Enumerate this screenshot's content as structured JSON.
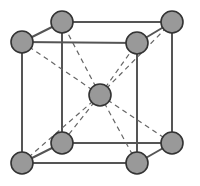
{
  "figure": {
    "background_color": "#ffffff",
    "width": 200,
    "height": 186
  },
  "style": {
    "atom_fill": "#999999",
    "atom_stroke": "#333333",
    "atom_stroke_width": 1.6,
    "atom_radius": 11,
    "edge_color": "#555555",
    "edge_width": 2,
    "diagonal_color": "#666666",
    "diagonal_width": 1.2,
    "diagonal_dash": "5,4"
  },
  "geometry": {
    "front_face": {
      "name": "front-face",
      "corners": [
        {
          "id": "front-top-left",
          "x": 22,
          "y": 42
        },
        {
          "id": "front-top-right",
          "x": 137,
          "y": 43
        },
        {
          "id": "front-bottom-right",
          "x": 137,
          "y": 163
        },
        {
          "id": "front-bottom-left",
          "x": 22,
          "y": 163
        }
      ]
    },
    "back_face": {
      "name": "back-face",
      "corners": [
        {
          "id": "back-top-left",
          "x": 62,
          "y": 22
        },
        {
          "id": "back-top-right",
          "x": 172,
          "y": 22
        },
        {
          "id": "back-bottom-right",
          "x": 172,
          "y": 143
        },
        {
          "id": "back-bottom-left",
          "x": 62,
          "y": 143
        }
      ]
    },
    "connectors": [
      {
        "id": "edge-top-left",
        "from": "front-top-left",
        "to": "back-top-left"
      },
      {
        "id": "edge-top-right",
        "from": "front-top-right",
        "to": "back-top-right"
      },
      {
        "id": "edge-bottom-right",
        "from": "front-bottom-right",
        "to": "back-bottom-right"
      },
      {
        "id": "edge-bottom-left",
        "from": "front-bottom-left",
        "to": "back-bottom-left"
      }
    ],
    "center_atom": {
      "id": "body-center",
      "x": 100,
      "y": 95
    }
  },
  "chart_data": {
    "type": "scatter",
    "xlabel": "",
    "ylabel": "",
    "atom_count": 9,
    "corner_atom_count": 8,
    "center_atom_count": 1,
    "atoms": [
      {
        "label": "front-top-left",
        "x": 22,
        "y": 42,
        "role": "corner"
      },
      {
        "label": "back-top-left",
        "x": 62,
        "y": 22,
        "role": "corner"
      },
      {
        "label": "back-top-right",
        "x": 172,
        "y": 22,
        "role": "corner"
      },
      {
        "label": "front-top-right",
        "x": 137,
        "y": 43,
        "role": "corner"
      },
      {
        "label": "body-center",
        "x": 100,
        "y": 95,
        "role": "center"
      },
      {
        "label": "back-bottom-left",
        "x": 62,
        "y": 143,
        "role": "corner"
      },
      {
        "label": "back-bottom-right",
        "x": 172,
        "y": 143,
        "role": "corner"
      },
      {
        "label": "front-bottom-left",
        "x": 22,
        "y": 163,
        "role": "corner"
      },
      {
        "label": "front-bottom-right",
        "x": 137,
        "y": 163,
        "role": "corner"
      }
    ],
    "body_diagonals": [
      {
        "from": "body-center",
        "to": "front-top-left"
      },
      {
        "from": "body-center",
        "to": "front-top-right"
      },
      {
        "from": "body-center",
        "to": "front-bottom-left"
      },
      {
        "from": "body-center",
        "to": "front-bottom-right"
      },
      {
        "from": "body-center",
        "to": "back-top-left"
      },
      {
        "from": "body-center",
        "to": "back-top-right"
      },
      {
        "from": "body-center",
        "to": "back-bottom-left"
      },
      {
        "from": "body-center",
        "to": "back-bottom-right"
      }
    ],
    "legend": [],
    "grid": false
  }
}
